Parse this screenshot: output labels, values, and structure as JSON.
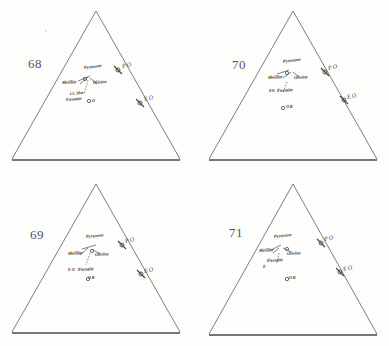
{
  "figure": {
    "type": "ternary-diagram-set",
    "panel_count": 4,
    "background_color": "#fdfdfc",
    "line_color": "#6f6f6f",
    "ink_color": "#2f2f33"
  },
  "panels": [
    {
      "number": "68",
      "number_position": {
        "x": 28,
        "y": 56
      },
      "labels": {
        "pyroxene": "Pyroxene",
        "melilite": "Melilite",
        "olivine": "Olivine",
        "fassaite": "Fassaite",
        "fassaite_prefix": "CC.Mar",
        "open_circle_marker": "O"
      },
      "edge_ticks": [
        {
          "label": "P O",
          "x": 122,
          "y": 66
        },
        {
          "label": "E O",
          "x": 143,
          "y": 98
        }
      ]
    },
    {
      "number": "70",
      "number_position": {
        "x": 37,
        "y": 57
      },
      "labels": {
        "pyroxene": "Pyroxene",
        "melilite": "Melilite",
        "olivine": "Olivine",
        "fassaite": "Fassaite",
        "fassaite_prefix": "EO",
        "open_circle_marker": "O B"
      },
      "edge_ticks": [
        {
          "label": "P O",
          "x": 124,
          "y": 66
        },
        {
          "label": "E O",
          "x": 143,
          "y": 95
        }
      ]
    },
    {
      "number": "69",
      "number_position": {
        "x": 30,
        "y": 54
      },
      "labels": {
        "pyroxene": "Pyroxene",
        "melilite": "Melilite",
        "olivine": "Olivine",
        "fassaite": "Fassaite",
        "fassaite_prefix": "E O",
        "open_circle_marker": "O B"
      },
      "edge_ticks": [
        {
          "label": "P O",
          "x": 120,
          "y": 66
        },
        {
          "label": "E O",
          "x": 140,
          "y": 95
        }
      ]
    },
    {
      "number": "71",
      "number_position": {
        "x": 34,
        "y": 52
      },
      "labels": {
        "pyroxene": "Pyroxene",
        "melilite": "Melilite",
        "olivine": "Olivine",
        "fassaite": "Fassaite",
        "fassaite_prefix": "E",
        "open_circle_marker": "O B"
      },
      "edge_ticks": [
        {
          "label": "P O",
          "x": 123,
          "y": 63
        },
        {
          "label": "E O",
          "x": 140,
          "y": 92
        }
      ]
    }
  ]
}
